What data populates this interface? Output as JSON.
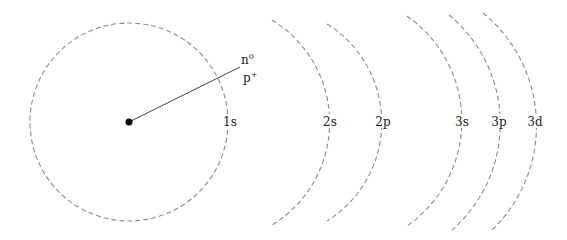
{
  "diagram": {
    "nucleus": {
      "labels": {
        "neutron_base": "n",
        "neutron_sup": "0",
        "proton_base": "p",
        "proton_sup": "+"
      }
    },
    "shells": [
      {
        "label": "1s"
      },
      {
        "label": "2s"
      },
      {
        "label": "2p"
      },
      {
        "label": "3s"
      },
      {
        "label": "3p"
      },
      {
        "label": "3d"
      }
    ],
    "colors": {
      "shell_stroke": "#8a8a8a",
      "nucleus": "#000000",
      "text": "#222222"
    }
  }
}
